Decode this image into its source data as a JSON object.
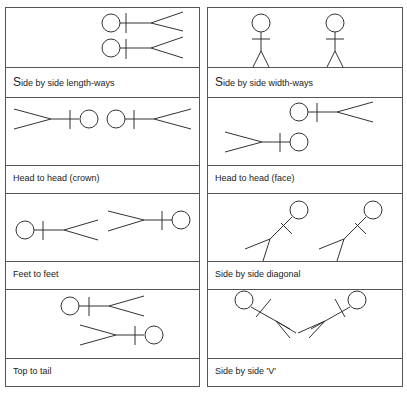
{
  "positions": [
    {
      "caption_first": "S",
      "caption_rest": "ide by side length-ways"
    },
    {
      "caption_first": "S",
      "caption_rest": "ide by side width-ways"
    },
    {
      "caption_first": "",
      "caption_rest": "Head to head (crown)"
    },
    {
      "caption_first": "",
      "caption_rest": "Head to head (face)"
    },
    {
      "caption_first": "",
      "caption_rest": "Feet to feet"
    },
    {
      "caption_first": "",
      "caption_rest": "Side by side diagonal"
    },
    {
      "caption_first": "",
      "caption_rest": "Top to tail"
    },
    {
      "caption_first": "",
      "caption_rest": "Side by side 'V'"
    }
  ],
  "colors": {
    "line": "#333333",
    "border": "#555555",
    "background": "#ffffff"
  }
}
